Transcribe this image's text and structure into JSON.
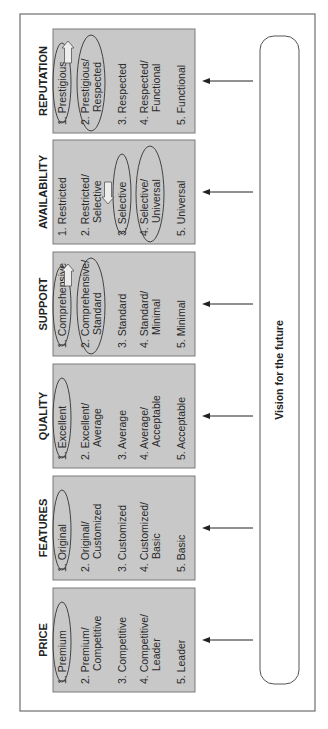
{
  "vision": {
    "label": "Vision for the future"
  },
  "dimensions": [
    {
      "id": "price",
      "title": "PRICE",
      "items": [
        {
          "lines": [
            "1. Premium"
          ],
          "circled": true
        },
        {
          "lines": [
            "2. Premium/",
            "Competitive"
          ],
          "circled": false
        },
        {
          "lines": [
            "3. Competitive"
          ],
          "circled": false
        },
        {
          "lines": [
            "4. Competitive/",
            "Leader"
          ],
          "circled": false
        },
        {
          "lines": [
            "5. Leader"
          ],
          "circled": false
        }
      ],
      "shift_arrow": null
    },
    {
      "id": "features",
      "title": "FEATURES",
      "items": [
        {
          "lines": [
            "1. Original"
          ],
          "circled": true
        },
        {
          "lines": [
            "2. Original/",
            "Customized"
          ],
          "circled": false
        },
        {
          "lines": [
            "3. Customized"
          ],
          "circled": false
        },
        {
          "lines": [
            "4. Customized/",
            "Basic"
          ],
          "circled": false
        },
        {
          "lines": [
            "5. Basic"
          ],
          "circled": false
        }
      ],
      "shift_arrow": null
    },
    {
      "id": "quality",
      "title": "QUALITY",
      "items": [
        {
          "lines": [
            "1. Excellent"
          ],
          "circled": true
        },
        {
          "lines": [
            "2. Excellent/",
            "Average"
          ],
          "circled": false
        },
        {
          "lines": [
            "3. Average"
          ],
          "circled": false
        },
        {
          "lines": [
            "4. Average/",
            "Acceptable"
          ],
          "circled": false
        },
        {
          "lines": [
            "5. Acceptable"
          ],
          "circled": false
        }
      ],
      "shift_arrow": null
    },
    {
      "id": "support",
      "title": "SUPPORT",
      "items": [
        {
          "lines": [
            "1. Comprehensive"
          ],
          "circled": true
        },
        {
          "lines": [
            "2. Comprehensive/",
            "Standard"
          ],
          "circled": true
        },
        {
          "lines": [
            "3. Standard"
          ],
          "circled": false
        },
        {
          "lines": [
            "4. Standard/",
            "Minimal"
          ],
          "circled": false
        },
        {
          "lines": [
            "5. Minimal"
          ],
          "circled": false
        }
      ],
      "shift_arrow": "toward-1"
    },
    {
      "id": "availability",
      "title": "AVAILABILITY",
      "items": [
        {
          "lines": [
            "1. Restricted"
          ],
          "circled": false
        },
        {
          "lines": [
            "2. Restricted/",
            "Selective"
          ],
          "circled": false
        },
        {
          "lines": [
            "3. Selective"
          ],
          "circled": true
        },
        {
          "lines": [
            "4. Selective/",
            "Universal"
          ],
          "circled": true
        },
        {
          "lines": [
            "5. Universal"
          ],
          "circled": false
        }
      ],
      "shift_arrow": "toward-5"
    },
    {
      "id": "reputation",
      "title": "REPUTATION",
      "items": [
        {
          "lines": [
            "1. Prestigious"
          ],
          "circled": true
        },
        {
          "lines": [
            "2. Prestigious/",
            "Respected"
          ],
          "circled": true
        },
        {
          "lines": [
            "3. Respected"
          ],
          "circled": false
        },
        {
          "lines": [
            "4. Respected/",
            "Functional"
          ],
          "circled": false
        },
        {
          "lines": [
            "5. Functional"
          ],
          "circled": false
        }
      ],
      "shift_arrow": "toward-1"
    }
  ]
}
